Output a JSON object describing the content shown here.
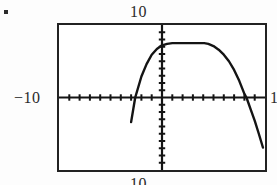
{
  "page": {
    "bullet_marker": "▪"
  },
  "graph": {
    "label_top": "10",
    "label_bottom": "10",
    "label_left": "−10",
    "label_right": "10"
  },
  "chart_data": {
    "type": "line",
    "title": "",
    "xlabel": "",
    "ylabel": "",
    "xlim": [
      -10,
      10
    ],
    "ylim": [
      -10,
      10
    ],
    "xticks": [
      -9,
      -8,
      -7,
      -6,
      -5,
      -4,
      -3,
      -2,
      -1,
      1,
      2,
      3,
      4,
      5,
      6,
      7,
      8,
      9
    ],
    "yticks": [
      -9,
      -8,
      -7,
      -6,
      -5,
      -4,
      -3,
      -2,
      -1,
      1,
      2,
      3,
      4,
      5,
      6,
      7,
      8,
      9
    ],
    "tick_labels_shown": false,
    "grid": false,
    "legend": false,
    "axis_style": "calculator-crosshair",
    "series": [
      {
        "name": "parabola",
        "type": "line",
        "color": "#141414",
        "equation_form": "downward parabola",
        "vertex": [
          4.1,
          7.5
        ],
        "x_intercepts": [
          -2.6,
          8.2
        ],
        "x": [
          -3.0,
          -2.6,
          -2.0,
          -1.5,
          -1.0,
          -0.5,
          0.0,
          0.5,
          1.0,
          1.5,
          2.0,
          2.5,
          3.0,
          3.5,
          4.0,
          4.1,
          4.5,
          5.0,
          5.5,
          6.0,
          6.5,
          7.0,
          7.5,
          8.0,
          8.2,
          8.6,
          9.0,
          9.4,
          9.8
        ],
        "y": [
          -3.4,
          0.0,
          2.9,
          4.6,
          5.9,
          6.7,
          7.2,
          7.4,
          7.5,
          7.5,
          7.5,
          7.5,
          7.5,
          7.5,
          7.5,
          7.5,
          7.4,
          7.1,
          6.6,
          5.9,
          5.0,
          3.8,
          2.3,
          0.5,
          0.0,
          -1.6,
          -3.2,
          -5.0,
          -6.9
        ]
      }
    ]
  }
}
